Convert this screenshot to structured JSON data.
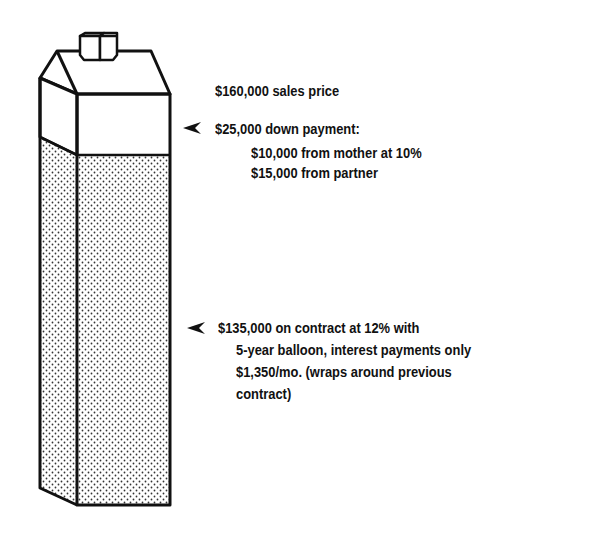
{
  "diagram": {
    "type": "stacked-bar-house",
    "segments": [
      {
        "name": "down-payment",
        "fill": "white",
        "value": 25000
      },
      {
        "name": "contract",
        "fill": "dotted",
        "value": 135000
      }
    ]
  },
  "labels": {
    "sales_price": "$160,000 sales price",
    "down_payment": {
      "title": "$25,000 down payment:",
      "lines": [
        "$10,000 from mother at 10%",
        "$15,000 from partner"
      ]
    },
    "contract": {
      "lines": [
        "$135,000 on contract at 12% with",
        "5-year balloon, interest payments only",
        "$1,350/mo. (wraps around previous",
        "contract)"
      ]
    }
  },
  "icons": {
    "pointer": "arrowhead-left"
  }
}
